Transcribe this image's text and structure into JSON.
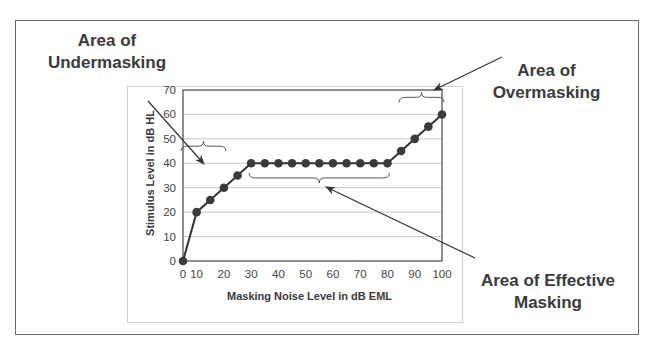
{
  "chart_data": {
    "type": "line",
    "title": "",
    "xlabel": "Masking Noise Level in dB EML",
    "ylabel": "Stimulus Level in dB HL",
    "x_tick_labels": [
      "0",
      "10",
      "20",
      "30",
      "40",
      "50",
      "60",
      "70",
      "80",
      "90",
      "100"
    ],
    "y_tick_labels": [
      "0",
      "10",
      "20",
      "30",
      "40",
      "50",
      "60",
      "70"
    ],
    "ylim": [
      0,
      70
    ],
    "xlim": [
      0,
      100
    ],
    "grid": "horizontal",
    "legend": null,
    "x": [
      0,
      10,
      15,
      20,
      25,
      30,
      35,
      40,
      45,
      50,
      55,
      60,
      65,
      70,
      75,
      80,
      85,
      90,
      95,
      100
    ],
    "values": [
      0,
      20,
      25,
      30,
      35,
      40,
      40,
      40,
      40,
      40,
      40,
      40,
      40,
      40,
      40,
      40,
      45,
      50,
      55,
      60
    ],
    "annotations": [
      {
        "text": "Area of Undermasking",
        "bracket_x_range": [
          0,
          20
        ],
        "bracket_y": 47
      },
      {
        "text": "Area of Effective Masking",
        "bracket_x_range": [
          30,
          80
        ],
        "bracket_y": 36
      },
      {
        "text": "Area of Overmasking",
        "bracket_x_range": [
          85,
          100
        ],
        "bracket_y": 67
      }
    ]
  },
  "annotations": {
    "undermasking": {
      "line1": "Area of",
      "line2": "Undermasking"
    },
    "overmasking": {
      "line1": "Area of",
      "line2": "Overmasking"
    },
    "effective": {
      "line1": "Area of Effective",
      "line2": "Masking"
    }
  },
  "axes": {
    "xlabel": "Masking Noise Level in dB EML",
    "ylabel": "Stimulus Level in dB HL"
  },
  "colors": {
    "line": "#333333",
    "marker": "#3a3a3a",
    "grid": "#c8c8c8",
    "frame": "#6a6a6a"
  }
}
